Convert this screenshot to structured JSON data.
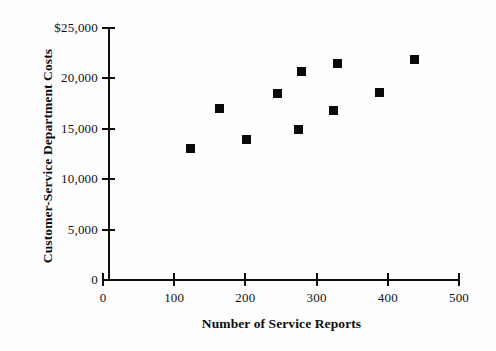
{
  "chart_data": {
    "type": "scatter",
    "title": "",
    "xlabel": "Number of Service Reports",
    "ylabel": "Customer-Service Department Costs",
    "xlim": [
      0,
      500
    ],
    "ylim": [
      0,
      25000
    ],
    "grid": false,
    "legend": null,
    "x_ticks": [
      {
        "value": 0,
        "label": "0"
      },
      {
        "value": 100,
        "label": "100"
      },
      {
        "value": 200,
        "label": "200"
      },
      {
        "value": 300,
        "label": "300"
      },
      {
        "value": 400,
        "label": "400"
      },
      {
        "value": 500,
        "label": "500"
      }
    ],
    "y_ticks": [
      {
        "value": 0,
        "label": "0"
      },
      {
        "value": 5000,
        "label": "5,000"
      },
      {
        "value": 10000,
        "label": "10,000"
      },
      {
        "value": 15000,
        "label": "15,000"
      },
      {
        "value": 20000,
        "label": "20,000"
      },
      {
        "value": 25000,
        "label": "$25,000"
      }
    ],
    "marker": {
      "shape": "square",
      "color": "#0a0a0a",
      "size": 9
    },
    "points": [
      {
        "x": 123,
        "y": 13000
      },
      {
        "x": 163,
        "y": 17000
      },
      {
        "x": 201,
        "y": 13900
      },
      {
        "x": 245,
        "y": 18500
      },
      {
        "x": 274,
        "y": 14900
      },
      {
        "x": 279,
        "y": 20700
      },
      {
        "x": 324,
        "y": 16800
      },
      {
        "x": 330,
        "y": 21500
      },
      {
        "x": 388,
        "y": 18600
      },
      {
        "x": 437,
        "y": 21900
      }
    ]
  },
  "style": {
    "background": "#fefefe",
    "axis_color": "#0d0d0d",
    "text_color": "#101010"
  }
}
